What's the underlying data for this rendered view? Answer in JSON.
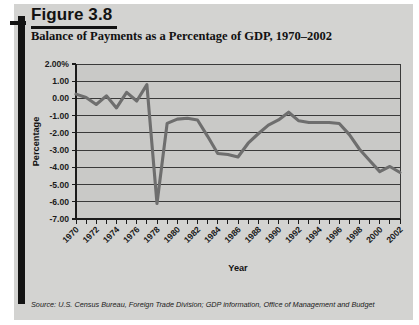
{
  "figure": {
    "label": "Figure 3.8",
    "title": "Balance of Payments as a Percentage of GDP, 1970–2002",
    "source": "Source: U.S. Census Bureau, Foreign Trade Division; GDP information, Office of Management and Budget"
  },
  "colors": {
    "panel": "#d3d3d1",
    "plot_bg": "#c9c9c7",
    "line": "#6e6e6e",
    "grid": "#3a3a3a",
    "axis": "#1b1b1b",
    "rule": "#131313"
  },
  "chart_data": {
    "type": "line",
    "title": "Balance of Payments as a Percentage of GDP, 1970–2002",
    "xlabel": "Year",
    "ylabel": "Percentage",
    "ylim": [
      -7.0,
      2.0
    ],
    "xlim": [
      1970,
      2002
    ],
    "ytick_labels": [
      "2.00%",
      "1.00",
      "0.00",
      "-1.00",
      "-2.00",
      "-3.00",
      "-4.00",
      "-5.00",
      "-6.00",
      "-7.00"
    ],
    "ytick_values": [
      2.0,
      1.0,
      0.0,
      -1.0,
      -2.0,
      -3.0,
      -4.0,
      -5.0,
      -6.0,
      -7.0
    ],
    "xtick_labels": [
      "1970",
      "1972",
      "1974",
      "1976",
      "1978",
      "1980",
      "1982",
      "1984",
      "1986",
      "1988",
      "1990",
      "1992",
      "1994",
      "1996",
      "1998",
      "2000",
      "2002"
    ],
    "xtick_values": [
      1970,
      1972,
      1974,
      1976,
      1978,
      1980,
      1982,
      1984,
      1986,
      1988,
      1990,
      1992,
      1994,
      1996,
      1998,
      2000,
      2002
    ],
    "grid": true,
    "grid_axis": "y",
    "legend": false,
    "x": [
      1970,
      1971,
      1972,
      1973,
      1974,
      1975,
      1976,
      1977,
      1978,
      1979,
      1980,
      1981,
      1982,
      1983,
      1984,
      1985,
      1986,
      1987,
      1988,
      1989,
      1990,
      1991,
      1992,
      1993,
      1994,
      1995,
      1996,
      1997,
      1998,
      1999,
      2000,
      2001,
      2002
    ],
    "values": [
      0.25,
      0.05,
      -0.35,
      0.15,
      -0.55,
      0.35,
      -0.15,
      0.8,
      -6.1,
      -1.45,
      -1.2,
      -1.15,
      -1.25,
      -2.2,
      -3.2,
      -3.25,
      -3.4,
      -2.6,
      -2.05,
      -1.55,
      -1.25,
      -0.8,
      -1.3,
      -1.4,
      -1.4,
      -1.4,
      -1.45,
      -2.1,
      -2.95,
      -3.6,
      -4.25,
      -3.95,
      -4.3
    ]
  }
}
